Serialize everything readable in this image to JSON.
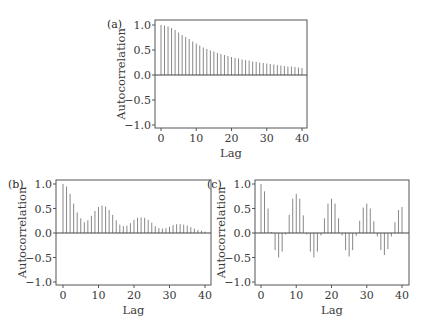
{
  "colors": {
    "frame": "#555555",
    "stem": "#888888",
    "zero_line": "#444444",
    "text": "#3a3a3a"
  },
  "chart_data": [
    {
      "type": "bar",
      "subtype": "stem",
      "panel_label": "(a)",
      "title": "",
      "xlabel": "Lag",
      "ylabel": "Autocorrelation",
      "xlim": [
        -1.5,
        41.5
      ],
      "ylim": [
        -1.05,
        1.1
      ],
      "xticks": [
        0,
        10,
        20,
        30,
        40
      ],
      "xtick_labels": [
        "0",
        "10",
        "20",
        "30",
        "40"
      ],
      "yticks": [
        1.0,
        0.5,
        0.0,
        -0.5,
        -1.0
      ],
      "ytick_labels": [
        "1.0",
        "0.5",
        "0.0",
        "−0.5",
        "−1.0"
      ],
      "grid": false,
      "x": [
        0,
        1,
        2,
        3,
        4,
        5,
        6,
        7,
        8,
        9,
        10,
        11,
        12,
        13,
        14,
        15,
        16,
        17,
        18,
        19,
        20,
        21,
        22,
        23,
        24,
        25,
        26,
        27,
        28,
        29,
        30,
        31,
        32,
        33,
        34,
        35,
        36,
        37,
        38,
        39,
        40
      ],
      "values": [
        1.0,
        0.99,
        0.97,
        0.94,
        0.9,
        0.85,
        0.8,
        0.76,
        0.72,
        0.67,
        0.63,
        0.59,
        0.55,
        0.52,
        0.49,
        0.47,
        0.44,
        0.42,
        0.4,
        0.38,
        0.36,
        0.34,
        0.33,
        0.31,
        0.3,
        0.29,
        0.27,
        0.26,
        0.25,
        0.24,
        0.23,
        0.22,
        0.21,
        0.2,
        0.19,
        0.18,
        0.17,
        0.17,
        0.16,
        0.15,
        0.14
      ],
      "frame": {
        "left": 155,
        "top": 20,
        "right": 307,
        "bottom": 128,
        "x0_px": 161,
        "x40_px": 302,
        "y1_px": 25,
        "yneg1_px": 125
      }
    },
    {
      "type": "bar",
      "subtype": "stem",
      "panel_label": "(b)",
      "title": "",
      "xlabel": "Lag",
      "ylabel": "Autocorrelation",
      "xlim": [
        -1.5,
        41.5
      ],
      "ylim": [
        -1.05,
        1.1
      ],
      "xticks": [
        0,
        10,
        20,
        30,
        40
      ],
      "xtick_labels": [
        "0",
        "10",
        "20",
        "30",
        "40"
      ],
      "yticks": [
        1.0,
        0.5,
        0.0,
        -0.5,
        -1.0
      ],
      "ytick_labels": [
        "1.0",
        "0.5",
        "0.0",
        "−0.5",
        "−1.0"
      ],
      "grid": false,
      "x": [
        0,
        1,
        2,
        3,
        4,
        5,
        6,
        7,
        8,
        9,
        10,
        11,
        12,
        13,
        14,
        15,
        16,
        17,
        18,
        19,
        20,
        21,
        22,
        23,
        24,
        25,
        26,
        27,
        28,
        29,
        30,
        31,
        32,
        33,
        34,
        35,
        36,
        37,
        38,
        39,
        40
      ],
      "values": [
        1.0,
        0.95,
        0.8,
        0.6,
        0.42,
        0.3,
        0.22,
        0.26,
        0.35,
        0.45,
        0.53,
        0.56,
        0.54,
        0.47,
        0.37,
        0.26,
        0.17,
        0.14,
        0.15,
        0.2,
        0.27,
        0.31,
        0.32,
        0.31,
        0.27,
        0.21,
        0.14,
        0.1,
        0.09,
        0.1,
        0.13,
        0.16,
        0.18,
        0.18,
        0.17,
        0.15,
        0.12,
        0.09,
        0.06,
        0.05,
        0.03
      ],
      "frame": {
        "left": 56,
        "top": 180,
        "right": 211,
        "bottom": 285,
        "x0_px": 63,
        "x40_px": 205,
        "y1_px": 184,
        "yneg1_px": 282
      }
    },
    {
      "type": "bar",
      "subtype": "stem",
      "panel_label": "(c)",
      "title": "",
      "xlabel": "Lag",
      "ylabel": "Autocorrelation",
      "xlim": [
        -1.5,
        41.5
      ],
      "ylim": [
        -1.05,
        1.1
      ],
      "xticks": [
        0,
        10,
        20,
        30,
        40
      ],
      "xtick_labels": [
        "0",
        "10",
        "20",
        "30",
        "40"
      ],
      "yticks": [
        1.0,
        0.5,
        0.0,
        -0.5,
        -1.0
      ],
      "ytick_labels": [
        "1.0",
        "0.5",
        "0.0",
        "−0.5",
        "−1.0"
      ],
      "grid": false,
      "x": [
        0,
        1,
        2,
        3,
        4,
        5,
        6,
        7,
        8,
        9,
        10,
        11,
        12,
        13,
        14,
        15,
        16,
        17,
        18,
        19,
        20,
        21,
        22,
        23,
        24,
        25,
        26,
        27,
        28,
        29,
        30,
        31,
        32,
        33,
        34,
        35,
        36,
        37,
        38,
        39,
        40
      ],
      "values": [
        1.0,
        0.85,
        0.5,
        0.02,
        -0.35,
        -0.5,
        -0.38,
        -0.03,
        0.37,
        0.7,
        0.8,
        0.7,
        0.36,
        -0.03,
        -0.38,
        -0.5,
        -0.38,
        -0.05,
        0.3,
        0.6,
        0.7,
        0.6,
        0.3,
        -0.05,
        -0.35,
        -0.48,
        -0.35,
        -0.06,
        0.25,
        0.52,
        0.6,
        0.5,
        0.24,
        -0.07,
        -0.35,
        -0.45,
        -0.33,
        -0.07,
        0.22,
        0.47,
        0.53
      ],
      "frame": {
        "left": 255,
        "top": 180,
        "right": 409,
        "bottom": 285,
        "x0_px": 261,
        "x40_px": 402,
        "y1_px": 184,
        "yneg1_px": 282
      }
    }
  ]
}
